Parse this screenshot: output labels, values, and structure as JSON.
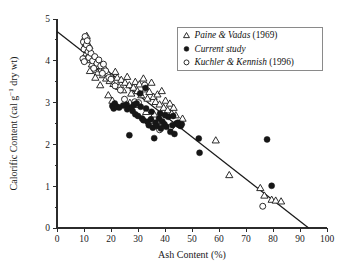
{
  "chart_data": {
    "type": "scatter",
    "title": "",
    "xlabel": "Ash Content (%)",
    "ylabel": "Calorific Content (cal g−1 dry wt)",
    "ylabel_main": "Calorific Content (cal g",
    "ylabel_sup": "−1",
    "ylabel_tail": " dry wt)",
    "xlim": [
      0,
      100
    ],
    "ylim": [
      0,
      5
    ],
    "xticks": [
      0,
      10,
      20,
      30,
      40,
      50,
      60,
      70,
      80,
      90,
      100
    ],
    "yticks": [
      0,
      1,
      2,
      3,
      4,
      5
    ],
    "xtick_labels": [
      "0",
      "10",
      "20",
      "30",
      "40",
      "50",
      "60",
      "70",
      "80",
      "90",
      "100"
    ],
    "ytick_labels": [
      "0",
      "1",
      "2",
      "3",
      "4",
      "5"
    ],
    "minor_yticks": [
      0.5,
      1.5,
      2.5,
      3.5,
      4.5
    ],
    "grid": false,
    "legend_position": "upper-right",
    "trendline": {
      "name": "linear regression",
      "x": [
        0,
        93.2
      ],
      "y": [
        4.7,
        0.0
      ],
      "intercept": 4.7,
      "slope": -0.0504
    },
    "series": [
      {
        "name": "Paine & Vadas (1969)",
        "marker": "open-triangle",
        "color": "#161616",
        "points": [
          [
            10.2,
            4.55
          ],
          [
            10.6,
            4.42
          ],
          [
            11.0,
            4.6
          ],
          [
            11.3,
            4.3
          ],
          [
            10.8,
            4.18
          ],
          [
            11.6,
            4.12
          ],
          [
            12.0,
            4.35
          ],
          [
            12.4,
            4.02
          ],
          [
            12.9,
            3.92
          ],
          [
            13.4,
            4.05
          ],
          [
            13.9,
            3.78
          ],
          [
            14.5,
            3.88
          ],
          [
            15.1,
            3.72
          ],
          [
            15.8,
            3.95
          ],
          [
            16.4,
            3.8
          ],
          [
            17.0,
            3.66
          ],
          [
            17.6,
            3.84
          ],
          [
            18.2,
            3.58
          ],
          [
            18.9,
            3.7
          ],
          [
            19.5,
            3.52
          ],
          [
            20.2,
            3.62
          ],
          [
            20.9,
            3.45
          ],
          [
            21.6,
            3.74
          ],
          [
            22.3,
            3.6
          ],
          [
            23.0,
            3.38
          ],
          [
            23.8,
            3.55
          ],
          [
            24.5,
            3.3
          ],
          [
            25.2,
            3.48
          ],
          [
            26.0,
            3.62
          ],
          [
            26.8,
            3.42
          ],
          [
            27.5,
            3.22
          ],
          [
            28.3,
            3.36
          ],
          [
            29.0,
            3.5
          ],
          [
            29.8,
            3.28
          ],
          [
            30.5,
            3.44
          ],
          [
            31.2,
            3.18
          ],
          [
            32.0,
            3.58
          ],
          [
            32.8,
            3.32
          ],
          [
            33.5,
            3.1
          ],
          [
            34.2,
            3.26
          ],
          [
            35.0,
            3.48
          ],
          [
            35.8,
            3.14
          ],
          [
            36.5,
            3.02
          ],
          [
            37.2,
            3.2
          ],
          [
            38.0,
            2.96
          ],
          [
            38.8,
            3.28
          ],
          [
            39.5,
            2.88
          ],
          [
            40.2,
            3.05
          ],
          [
            41.0,
            2.82
          ],
          [
            41.8,
            2.98
          ],
          [
            42.5,
            2.74
          ],
          [
            43.2,
            2.88
          ],
          [
            44.0,
            2.7
          ],
          [
            19.0,
            3.18
          ],
          [
            20.5,
            3.05
          ],
          [
            22.0,
            2.92
          ],
          [
            27.0,
            3.0
          ],
          [
            30.0,
            2.95
          ],
          [
            33.0,
            2.78
          ],
          [
            36.0,
            2.72
          ],
          [
            46.5,
            2.62
          ],
          [
            58.8,
            2.1
          ],
          [
            63.8,
            1.27
          ],
          [
            75.3,
            0.96
          ],
          [
            76.8,
            0.78
          ],
          [
            79.5,
            0.68
          ],
          [
            81.0,
            0.66
          ],
          [
            83.0,
            0.64
          ],
          [
            16.0,
            3.42
          ],
          [
            14.2,
            3.6
          ],
          [
            12.2,
            3.76
          ]
        ]
      },
      {
        "name": "Current study",
        "marker": "filled-circle",
        "color": "#161616",
        "points": [
          [
            20.5,
            2.92
          ],
          [
            21.0,
            2.86
          ],
          [
            21.4,
            2.98
          ],
          [
            22.2,
            2.9
          ],
          [
            26.8,
            2.22
          ],
          [
            27.5,
            2.88
          ],
          [
            28.0,
            2.8
          ],
          [
            28.5,
            2.95
          ],
          [
            29.0,
            2.72
          ],
          [
            30.0,
            2.68
          ],
          [
            30.8,
            3.22
          ],
          [
            31.5,
            2.62
          ],
          [
            32.0,
            2.58
          ],
          [
            32.8,
            3.35
          ],
          [
            33.5,
            2.54
          ],
          [
            34.0,
            2.46
          ],
          [
            34.8,
            2.6
          ],
          [
            35.5,
            2.4
          ],
          [
            36.0,
            2.15
          ],
          [
            36.5,
            2.52
          ],
          [
            37.0,
            2.44
          ],
          [
            37.8,
            2.62
          ],
          [
            38.5,
            2.38
          ],
          [
            39.0,
            2.55
          ],
          [
            39.8,
            2.48
          ],
          [
            40.5,
            2.42
          ],
          [
            41.2,
            2.66
          ],
          [
            42.0,
            2.3
          ],
          [
            42.8,
            2.46
          ],
          [
            43.5,
            2.25
          ],
          [
            44.2,
            2.5
          ],
          [
            45.0,
            2.47
          ],
          [
            45.8,
            2.44
          ],
          [
            46.2,
            2.48
          ],
          [
            52.5,
            2.14
          ],
          [
            52.8,
            1.8
          ],
          [
            79.5,
            1.01
          ],
          [
            77.8,
            2.12
          ],
          [
            31.0,
            2.9
          ],
          [
            29.5,
            2.98
          ],
          [
            25.8,
            2.95
          ],
          [
            33.0,
            2.86
          ],
          [
            35.0,
            2.78
          ],
          [
            38.2,
            2.74
          ],
          [
            40.0,
            2.7
          ],
          [
            43.0,
            2.68
          ],
          [
            44.8,
            2.52
          ],
          [
            24.5,
            2.93
          ],
          [
            23.0,
            2.88
          ],
          [
            26.0,
            2.84
          ]
        ]
      },
      {
        "name": "Kuchler & Kennish (1996)",
        "marker": "open-circle",
        "color": "#161616",
        "points": [
          [
            9.8,
            4.45
          ],
          [
            10.0,
            4.28
          ],
          [
            10.4,
            4.58
          ],
          [
            10.9,
            4.38
          ],
          [
            9.6,
            4.05
          ],
          [
            10.1,
            3.98
          ],
          [
            11.2,
            4.48
          ],
          [
            11.5,
            4.22
          ],
          [
            11.8,
            4.08
          ],
          [
            12.6,
            4.18
          ],
          [
            13.2,
            4.0
          ],
          [
            14.0,
            4.1
          ],
          [
            14.8,
            3.94
          ],
          [
            15.5,
            4.02
          ],
          [
            16.2,
            3.88
          ],
          [
            17.2,
            3.92
          ],
          [
            18.0,
            3.76
          ],
          [
            19.2,
            3.6
          ],
          [
            20.0,
            3.56
          ],
          [
            21.5,
            3.4
          ],
          [
            23.5,
            3.3
          ],
          [
            25.0,
            3.08
          ],
          [
            28.8,
            3.02
          ],
          [
            30.2,
            3.0
          ],
          [
            32.5,
            3.42
          ],
          [
            35.2,
            2.44
          ],
          [
            38.0,
            2.35
          ],
          [
            39.0,
            2.52
          ],
          [
            42.2,
            2.42
          ],
          [
            45.5,
            2.46
          ],
          [
            76.2,
            0.52
          ],
          [
            12.0,
            4.3
          ],
          [
            13.6,
            3.82
          ],
          [
            16.8,
            3.7
          ]
        ]
      }
    ]
  },
  "legend": {
    "entries": [
      {
        "marker": "open-triangle",
        "italic_text": "Paine & Vadas",
        "plain_text": " (1969)"
      },
      {
        "marker": "filled-circle",
        "italic_text": "Current study",
        "plain_text": ""
      },
      {
        "marker": "open-circle",
        "italic_text": "Kuchler & Kennish",
        "plain_text": " (1996)"
      }
    ]
  },
  "colors": {
    "ink": "#161616",
    "axis": "#2b2b2b",
    "legend_border": "#8a8a8a",
    "background": "#ffffff"
  }
}
